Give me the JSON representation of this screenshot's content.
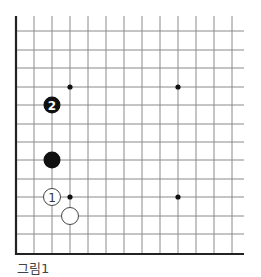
{
  "diagram": {
    "type": "go-board-corner",
    "caption": "그림1",
    "grid": {
      "x_lines": [
        16,
        34,
        52,
        70,
        88,
        106,
        124,
        142,
        160,
        178,
        196,
        214,
        232
      ],
      "y_lines": [
        31,
        50,
        68,
        87,
        105,
        124,
        142,
        160,
        179,
        197,
        216,
        234
      ],
      "top": 16,
      "bottom": 254,
      "left": 16,
      "right": 244,
      "line_color": "#8a8a8a",
      "border_color": "#222222"
    },
    "star_points": [
      {
        "x": 70,
        "y": 87
      },
      {
        "x": 178,
        "y": 87
      },
      {
        "x": 70,
        "y": 197
      },
      {
        "x": 178,
        "y": 197
      }
    ],
    "stones": [
      {
        "color": "black",
        "x": 52,
        "y": 105,
        "label": "2"
      },
      {
        "color": "black",
        "x": 52,
        "y": 160,
        "label": ""
      },
      {
        "color": "white",
        "x": 52,
        "y": 197,
        "label": "1"
      },
      {
        "color": "white",
        "x": 70,
        "y": 216,
        "label": ""
      }
    ]
  }
}
